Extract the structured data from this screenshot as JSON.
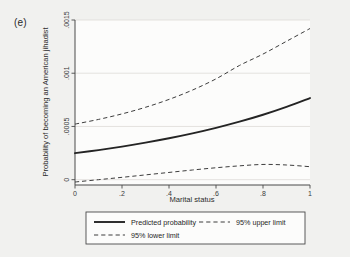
{
  "figure": {
    "panel_label": "(e)",
    "background_color": "#f1f1ef",
    "plot_background_color": "#fcfcfb"
  },
  "legend": {
    "entries": [
      {
        "label": "Predicted probability",
        "style": "solid"
      },
      {
        "label": "95% upper limit",
        "style": "dashed"
      },
      {
        "label": "95% lower limit",
        "style": "dashed"
      }
    ]
  },
  "chart_data": {
    "type": "line",
    "title": "",
    "subtitle": "",
    "xlabel": "Marital status",
    "ylabel": "Probability of becoming an American jihadist",
    "xlim": [
      0,
      1
    ],
    "ylim": [
      -5e-05,
      0.0015
    ],
    "xticks": [
      0,
      0.2,
      0.4,
      0.6,
      0.8,
      1
    ],
    "xticklabels": [
      "0",
      ".2",
      ".4",
      ".6",
      ".8",
      "1"
    ],
    "yticks": [
      0,
      0.0005,
      0.001,
      0.0015
    ],
    "yticklabels": [
      "0",
      ".0005",
      ".001",
      ".0015"
    ],
    "grid": true,
    "grid_axis": "y",
    "legend_position": "below",
    "x": [
      0,
      0.1,
      0.2,
      0.3,
      0.4,
      0.5,
      0.6,
      0.7,
      0.8,
      0.9,
      1
    ],
    "series": [
      {
        "name": "Predicted probability",
        "style": "solid",
        "color": "#242424",
        "values": [
          0.000249,
          0.000278,
          0.000311,
          0.000348,
          0.000389,
          0.000435,
          0.000487,
          0.000545,
          0.00061,
          0.000684,
          0.000767
        ]
      },
      {
        "name": "95% upper limit",
        "style": "dashed",
        "color": "#3d3d3d",
        "values": [
          0.000522,
          0.000566,
          0.000618,
          0.00068,
          0.000754,
          0.000842,
          0.000947,
          0.001073,
          0.00118,
          0.0013,
          0.00142
        ]
      },
      {
        "name": "95% lower limit",
        "style": "dashed",
        "color": "#3d3d3d",
        "values": [
          -2.2e-05,
          0.0,
          2.2e-05,
          4.5e-05,
          6.8e-05,
          9.1e-05,
          0.000112,
          0.00013,
          0.000143,
          0.000138,
          0.000122
        ]
      }
    ]
  }
}
